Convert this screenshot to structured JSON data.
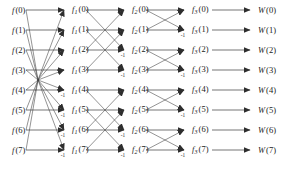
{
  "figure": {
    "width": 306,
    "height": 171,
    "background": "#ffffff",
    "line_color": "#3b3b3b",
    "text_color": "#1a1a1a"
  },
  "layout": {
    "row_y": [
      10,
      30,
      50,
      70,
      90,
      110,
      130,
      150
    ],
    "column_x": [
      12,
      72,
      132,
      192,
      258
    ],
    "arrow_x": [
      64,
      124,
      184,
      250
    ],
    "n_rows": 8,
    "n_columns": 5
  },
  "columns": [
    {
      "name": "input",
      "symbol": "f",
      "subscript": "",
      "x": 12,
      "labels": [
        {
          "symbol": "f",
          "sub": "",
          "index": "(0)",
          "text": "f (0)"
        },
        {
          "symbol": "f",
          "sub": "",
          "index": "(1)",
          "text": "f (1)"
        },
        {
          "symbol": "f",
          "sub": "",
          "index": "(2)",
          "text": "f (2)"
        },
        {
          "symbol": "f",
          "sub": "",
          "index": "(3)",
          "text": "f (3)"
        },
        {
          "symbol": "f",
          "sub": "",
          "index": "(4)",
          "text": "f (4)"
        },
        {
          "symbol": "f",
          "sub": "",
          "index": "(5)",
          "text": "f (5)"
        },
        {
          "symbol": "f",
          "sub": "",
          "index": "(6)",
          "text": "f (6)"
        },
        {
          "symbol": "f",
          "sub": "",
          "index": "(7)",
          "text": "f (7)"
        }
      ]
    },
    {
      "name": "stage-1-output",
      "symbol": "f",
      "subscript": "1",
      "x": 72,
      "labels": [
        {
          "symbol": "f",
          "sub": "1",
          "index": "(0)",
          "text": "f1 (0)"
        },
        {
          "symbol": "f",
          "sub": "1",
          "index": "(1)",
          "text": "f1 (1)"
        },
        {
          "symbol": "f",
          "sub": "1",
          "index": "(2)",
          "text": "f1 (2)"
        },
        {
          "symbol": "f",
          "sub": "1",
          "index": "(3)",
          "text": "f1 (3)"
        },
        {
          "symbol": "f",
          "sub": "1",
          "index": "(4)",
          "text": "f1 (4)"
        },
        {
          "symbol": "f",
          "sub": "1",
          "index": "(5)",
          "text": "f1 (5)"
        },
        {
          "symbol": "f",
          "sub": "1",
          "index": "(6)",
          "text": "f1 (6)"
        },
        {
          "symbol": "f",
          "sub": "1",
          "index": "(7)",
          "text": "f1 (7)"
        }
      ]
    },
    {
      "name": "stage-2-output",
      "symbol": "f",
      "subscript": "2",
      "x": 132,
      "labels": [
        {
          "symbol": "f",
          "sub": "2",
          "index": "(0)",
          "text": "f2 (0)"
        },
        {
          "symbol": "f",
          "sub": "2",
          "index": "(1)",
          "text": "f2 (1)"
        },
        {
          "symbol": "f",
          "sub": "2",
          "index": "(2)",
          "text": "f2 (2)"
        },
        {
          "symbol": "f",
          "sub": "2",
          "index": "(3)",
          "text": "f2 (3)"
        },
        {
          "symbol": "f",
          "sub": "2",
          "index": "(4)",
          "text": "f2 (4)"
        },
        {
          "symbol": "f",
          "sub": "2",
          "index": "(5)",
          "text": "f2 (5)"
        },
        {
          "symbol": "f",
          "sub": "2",
          "index": "(6)",
          "text": "f2 (6)"
        },
        {
          "symbol": "f",
          "sub": "2",
          "index": "(7)",
          "text": "f2 (7)"
        }
      ]
    },
    {
      "name": "stage-3-output",
      "symbol": "f",
      "subscript": "3",
      "x": 192,
      "labels": [
        {
          "symbol": "f",
          "sub": "3",
          "index": "(0)",
          "text": "f3 (0)"
        },
        {
          "symbol": "f",
          "sub": "3",
          "index": "(1)",
          "text": "f3 (1)"
        },
        {
          "symbol": "f",
          "sub": "3",
          "index": "(2)",
          "text": "f3 (2)"
        },
        {
          "symbol": "f",
          "sub": "3",
          "index": "(3)",
          "text": "f3 (3)"
        },
        {
          "symbol": "f",
          "sub": "3",
          "index": "(4)",
          "text": "f3 (4)"
        },
        {
          "symbol": "f",
          "sub": "3",
          "index": "(5)",
          "text": "f3 (5)"
        },
        {
          "symbol": "f",
          "sub": "3",
          "index": "(6)",
          "text": "f3 (6)"
        },
        {
          "symbol": "f",
          "sub": "3",
          "index": "(7)",
          "text": "f3 (7)"
        }
      ]
    },
    {
      "name": "output",
      "symbol": "W",
      "subscript": "",
      "x": 258,
      "labels": [
        {
          "symbol": "W",
          "sub": "",
          "index": "(0)",
          "text": "W (0)"
        },
        {
          "symbol": "W",
          "sub": "",
          "index": "(1)",
          "text": "W (1)"
        },
        {
          "symbol": "W",
          "sub": "",
          "index": "(2)",
          "text": "W (2)"
        },
        {
          "symbol": "W",
          "sub": "",
          "index": "(3)",
          "text": "W (3)"
        },
        {
          "symbol": "W",
          "sub": "",
          "index": "(4)",
          "text": "W (4)"
        },
        {
          "symbol": "W",
          "sub": "",
          "index": "(5)",
          "text": "W (5)"
        },
        {
          "symbol": "W",
          "sub": "",
          "index": "(6)",
          "text": "W (6)"
        },
        {
          "symbol": "W",
          "sub": "",
          "index": "(7)",
          "text": "W (7)"
        }
      ]
    }
  ],
  "stages": [
    {
      "name": "stage-1",
      "span": 4,
      "from_x": 26,
      "to_x": 64,
      "converging": true,
      "edges": [
        {
          "from": 0,
          "to": 0,
          "gain": ""
        },
        {
          "from": 1,
          "to": 1,
          "gain": ""
        },
        {
          "from": 2,
          "to": 2,
          "gain": ""
        },
        {
          "from": 3,
          "to": 3,
          "gain": ""
        },
        {
          "from": 4,
          "to": 4,
          "gain": "-1"
        },
        {
          "from": 5,
          "to": 5,
          "gain": "-1"
        },
        {
          "from": 6,
          "to": 6,
          "gain": "-1"
        },
        {
          "from": 7,
          "to": 7,
          "gain": "-1"
        },
        {
          "from": 4,
          "to": 0,
          "gain": ""
        },
        {
          "from": 5,
          "to": 1,
          "gain": ""
        },
        {
          "from": 6,
          "to": 2,
          "gain": ""
        },
        {
          "from": 7,
          "to": 3,
          "gain": ""
        },
        {
          "from": 0,
          "to": 4,
          "gain": ""
        },
        {
          "from": 1,
          "to": 5,
          "gain": ""
        },
        {
          "from": 2,
          "to": 6,
          "gain": ""
        },
        {
          "from": 3,
          "to": 7,
          "gain": ""
        }
      ],
      "minus_one_rows": [
        4,
        5,
        6,
        7
      ]
    },
    {
      "name": "stage-2",
      "span": 2,
      "from_x": 86,
      "to_x": 124,
      "converging": false,
      "edges": [
        {
          "from": 0,
          "to": 0,
          "gain": ""
        },
        {
          "from": 1,
          "to": 1,
          "gain": ""
        },
        {
          "from": 2,
          "to": 2,
          "gain": "-1"
        },
        {
          "from": 3,
          "to": 3,
          "gain": "-1"
        },
        {
          "from": 4,
          "to": 4,
          "gain": ""
        },
        {
          "from": 5,
          "to": 5,
          "gain": ""
        },
        {
          "from": 6,
          "to": 6,
          "gain": "-1"
        },
        {
          "from": 7,
          "to": 7,
          "gain": "-1"
        },
        {
          "from": 2,
          "to": 0,
          "gain": ""
        },
        {
          "from": 3,
          "to": 1,
          "gain": ""
        },
        {
          "from": 0,
          "to": 2,
          "gain": ""
        },
        {
          "from": 1,
          "to": 3,
          "gain": ""
        },
        {
          "from": 6,
          "to": 4,
          "gain": ""
        },
        {
          "from": 7,
          "to": 5,
          "gain": ""
        },
        {
          "from": 4,
          "to": 6,
          "gain": ""
        },
        {
          "from": 5,
          "to": 7,
          "gain": ""
        }
      ],
      "minus_one_rows": [
        2,
        3,
        6,
        7
      ]
    },
    {
      "name": "stage-3",
      "span": 1,
      "from_x": 146,
      "to_x": 184,
      "converging": false,
      "edges": [
        {
          "from": 0,
          "to": 0,
          "gain": ""
        },
        {
          "from": 1,
          "to": 1,
          "gain": "-1"
        },
        {
          "from": 2,
          "to": 2,
          "gain": ""
        },
        {
          "from": 3,
          "to": 3,
          "gain": "-1"
        },
        {
          "from": 4,
          "to": 4,
          "gain": ""
        },
        {
          "from": 5,
          "to": 5,
          "gain": "-1"
        },
        {
          "from": 6,
          "to": 6,
          "gain": ""
        },
        {
          "from": 7,
          "to": 7,
          "gain": "-1"
        },
        {
          "from": 1,
          "to": 0,
          "gain": ""
        },
        {
          "from": 0,
          "to": 1,
          "gain": ""
        },
        {
          "from": 3,
          "to": 2,
          "gain": ""
        },
        {
          "from": 2,
          "to": 3,
          "gain": ""
        },
        {
          "from": 5,
          "to": 4,
          "gain": ""
        },
        {
          "from": 4,
          "to": 5,
          "gain": ""
        },
        {
          "from": 7,
          "to": 6,
          "gain": ""
        },
        {
          "from": 6,
          "to": 7,
          "gain": ""
        }
      ],
      "minus_one_rows": [
        1,
        3,
        5,
        7
      ]
    },
    {
      "name": "stage-4-output",
      "span": 0,
      "from_x": 212,
      "to_x": 250,
      "converging": false,
      "edges": [
        {
          "from": 0,
          "to": 0,
          "gain": ""
        },
        {
          "from": 1,
          "to": 1,
          "gain": ""
        },
        {
          "from": 2,
          "to": 2,
          "gain": ""
        },
        {
          "from": 3,
          "to": 3,
          "gain": ""
        },
        {
          "from": 4,
          "to": 4,
          "gain": ""
        },
        {
          "from": 5,
          "to": 5,
          "gain": ""
        },
        {
          "from": 6,
          "to": 6,
          "gain": ""
        },
        {
          "from": 7,
          "to": 7,
          "gain": ""
        }
      ],
      "minus_one_rows": []
    }
  ],
  "annotations": {
    "gain_label": "-1"
  }
}
